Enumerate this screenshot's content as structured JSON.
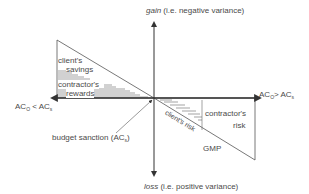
{
  "axes": {
    "top_label_italic": "gain",
    "top_label_rest": " (i.e. negative variance)",
    "bottom_label_italic": "loss",
    "bottom_label_rest": " (i.e. positive variance)",
    "left_label": {
      "a": "AC",
      "a_sub": "O",
      "op": " < AC",
      "b_sub": "s"
    },
    "right_label": {
      "a": "AC",
      "a_sub": "O",
      "op": "> AC",
      "b_sub": "s"
    }
  },
  "regions": {
    "clients_savings": [
      "client's",
      "savings"
    ],
    "contractors_rewards": [
      "contractor's",
      "rewards"
    ],
    "contractors_risk": [
      "contractor's",
      "risk"
    ],
    "clients_risk": "client's risk",
    "gmp": "GMP"
  },
  "annotation": {
    "text": "budget sanction (AC",
    "sub": "s",
    "close": ")"
  },
  "colors": {
    "line": "#555555",
    "text": "#4a4a4a",
    "hatch": "#666666"
  }
}
